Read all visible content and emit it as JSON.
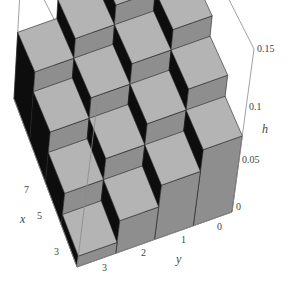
{
  "chart_data": {
    "type": "bar3d",
    "title": "",
    "xlabel": "x",
    "ylabel": "y",
    "zlabel": "h",
    "x_ticks": [
      "3",
      "5",
      "7"
    ],
    "y_ticks": [
      "3",
      "2",
      "1",
      "0"
    ],
    "z_ticks": [
      "0",
      "0.05",
      "0.1",
      "0.15"
    ],
    "zlim": [
      0,
      0.15
    ],
    "x_bins": [
      2,
      4,
      6,
      8
    ],
    "y_bins": [
      0,
      1,
      2,
      3
    ],
    "heights": [
      {
        "x": 2,
        "y": 0,
        "h": 0.07
      },
      {
        "x": 2,
        "y": 1,
        "h": 0.05
      },
      {
        "x": 2,
        "y": 2,
        "h": 0.03
      },
      {
        "x": 2,
        "y": 3,
        "h": 0.01
      },
      {
        "x": 4,
        "y": 0,
        "h": 0.09
      },
      {
        "x": 4,
        "y": 1,
        "h": 0.07
      },
      {
        "x": 4,
        "y": 2,
        "h": 0.05
      },
      {
        "x": 4,
        "y": 3,
        "h": 0.03
      },
      {
        "x": 6,
        "y": 0,
        "h": 0.11
      },
      {
        "x": 6,
        "y": 1,
        "h": 0.09
      },
      {
        "x": 6,
        "y": 2,
        "h": 0.07
      },
      {
        "x": 6,
        "y": 3,
        "h": 0.05
      },
      {
        "x": 8,
        "y": 0,
        "h": 0.13
      },
      {
        "x": 8,
        "y": 1,
        "h": 0.11
      },
      {
        "x": 8,
        "y": 2,
        "h": 0.09
      },
      {
        "x": 8,
        "y": 3,
        "h": 0.07
      }
    ],
    "colors": {
      "top": "#b4b4b4",
      "front": "#8e8e8e",
      "side": "#0d0d0d",
      "box": "#8a8a8a",
      "text": "#444444"
    }
  },
  "labels": {
    "x_axis": "x",
    "y_axis": "y",
    "h_axis": "h",
    "x_tick_3": "3",
    "x_tick_5": "5",
    "x_tick_7": "7",
    "y_tick_3": "3",
    "y_tick_2": "2",
    "y_tick_1": "1",
    "y_tick_0": "0",
    "h_tick_0": "0",
    "h_tick_005": "0.05",
    "h_tick_01": "0.1",
    "h_tick_015": "0.15"
  }
}
